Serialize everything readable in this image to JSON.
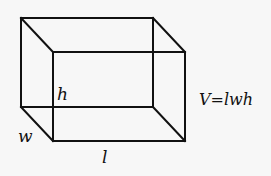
{
  "diagram": {
    "shape": "rectangular prism",
    "labels": {
      "height": "h",
      "width": "w",
      "length": "l"
    },
    "formula": "V=lwh"
  }
}
